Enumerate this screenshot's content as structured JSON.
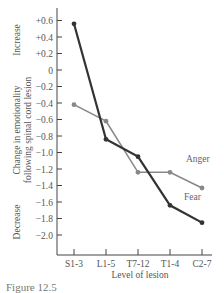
{
  "chart_data": {
    "type": "line",
    "title": "",
    "xlabel": "Level of lesion",
    "ylabel": "Change in emotionality following spinal cord lesion",
    "ylabel_increase": "Increase",
    "ylabel_decrease": "Decrease",
    "categories": [
      "S1-3",
      "L1-5",
      "T7-12",
      "T1-4",
      "C2-7"
    ],
    "yticks": [
      "+0.6",
      "+0.4",
      "+0.2",
      "0",
      "-0.2",
      "-0.4",
      "-0.6",
      "-0.8",
      "-1.0",
      "-1.2",
      "-1.4",
      "-1.6",
      "-1.8",
      "-2.0"
    ],
    "ylim": [
      -2.2,
      0.7
    ],
    "grid": false,
    "series": [
      {
        "name": "Fear",
        "values": [
          0.56,
          -0.84,
          -1.05,
          -1.64,
          -1.85
        ],
        "color": "#333333"
      },
      {
        "name": "Anger",
        "values": [
          -0.42,
          -0.62,
          -1.24,
          -1.24,
          -1.43
        ],
        "color": "#888888"
      }
    ]
  },
  "caption": "Figure 12.5"
}
